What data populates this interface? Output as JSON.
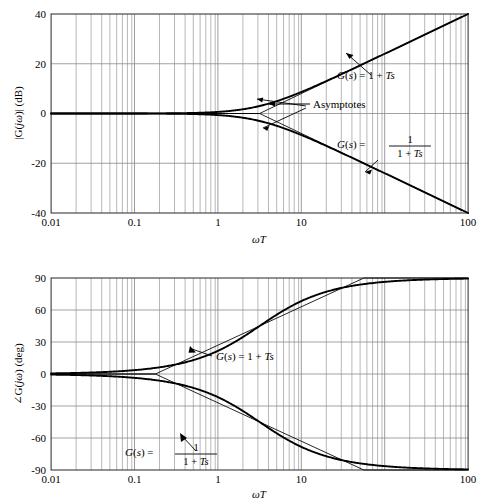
{
  "figure": {
    "kind": "bode-plot-pair"
  },
  "magnitude_plot": {
    "y_axis_label": "|G(jω)| (dB)",
    "x_axis_label": "ωT",
    "y_ticks": [
      "40",
      "20",
      "0",
      "-20",
      "-40"
    ],
    "x_ticks": [
      "0.01",
      "0.1",
      "1",
      "10",
      "100"
    ],
    "annotations": {
      "asymptotes": "Asymptotes",
      "lead_label": "G(s) = 1 + Ts",
      "lag_label_lhs": "G(s) =",
      "lag_label_num": "1",
      "lag_label_den": "1 + Ts"
    }
  },
  "phase_plot": {
    "y_axis_label": "∠G(jω) (deg)",
    "x_axis_label": "ωT",
    "y_ticks": [
      "90",
      "60",
      "30",
      "0",
      "-30",
      "-60",
      "-90"
    ],
    "x_ticks": [
      "0.01",
      "0.1",
      "1",
      "10",
      "100"
    ],
    "annotations": {
      "lead_label": "G(s) = 1 + Ts",
      "lag_label_lhs": "G(s) =",
      "lag_label_num": "1",
      "lag_label_den": "1 + Ts"
    }
  },
  "chart_data": [
    {
      "type": "line",
      "title": "Magnitude Bode plot",
      "xlabel": "ωT",
      "ylabel": "|G(jω)| (dB)",
      "xscale": "log",
      "xlim": [
        0.01,
        100
      ],
      "ylim": [
        -40,
        40
      ],
      "xticks": [
        0.01,
        0.1,
        1,
        10,
        100
      ],
      "yticks": [
        -40,
        -20,
        0,
        20,
        40
      ],
      "grid": true,
      "minor_grid": true,
      "legend": "inline-annotations",
      "series": [
        {
          "name": "G(s) = 1 + Ts",
          "style": "solid-thick",
          "x": [
            0.01,
            0.02,
            0.05,
            0.1,
            0.2,
            0.3,
            0.5,
            0.7,
            1,
            1.5,
            2,
            3,
            5,
            7,
            10,
            20,
            50,
            100
          ],
          "y": [
            0.0,
            0.0,
            0.01,
            0.04,
            0.17,
            0.37,
            0.97,
            1.72,
            3.01,
            5.11,
            6.99,
            10.0,
            14.15,
            16.9,
            20.04,
            26.03,
            33.98,
            40.0
          ]
        },
        {
          "name": "G(s) = 1/(1 + Ts)",
          "style": "solid-thick",
          "x": [
            0.01,
            0.02,
            0.05,
            0.1,
            0.2,
            0.3,
            0.5,
            0.7,
            1,
            1.5,
            2,
            3,
            5,
            7,
            10,
            20,
            50,
            100
          ],
          "y": [
            0.0,
            0.0,
            -0.01,
            -0.04,
            -0.17,
            -0.37,
            -0.97,
            -1.72,
            -3.01,
            -5.11,
            -6.99,
            -10.0,
            -14.15,
            -16.9,
            -20.04,
            -26.03,
            -33.98,
            -40.0
          ]
        },
        {
          "name": "Asymptote (lead)",
          "style": "solid-thin",
          "x": [
            0.01,
            1,
            100
          ],
          "y": [
            0,
            0,
            40
          ]
        },
        {
          "name": "Asymptote (lag)",
          "style": "solid-thin",
          "x": [
            0.01,
            1,
            100
          ],
          "y": [
            0,
            0,
            -40
          ]
        }
      ],
      "annotations": [
        {
          "text": "Asymptotes",
          "x": 2.0,
          "y": 2.0
        },
        {
          "text": "G(s) = 1 + Ts",
          "x": 9.0,
          "y": 14.0
        },
        {
          "text": "G(s) = 1/(1 + Ts)",
          "x": 9.0,
          "y": -11.0
        }
      ],
      "corner_frequency": 1
    },
    {
      "type": "line",
      "title": "Phase Bode plot",
      "xlabel": "ωT",
      "ylabel": "∠G(jω) (deg)",
      "xscale": "log",
      "xlim": [
        0.01,
        100
      ],
      "ylim": [
        -90,
        90
      ],
      "xticks": [
        0.01,
        0.1,
        1,
        10,
        100
      ],
      "yticks": [
        -90,
        -60,
        -30,
        0,
        30,
        60,
        90
      ],
      "grid": true,
      "minor_grid": true,
      "legend": "inline-annotations",
      "series": [
        {
          "name": "G(s) = 1 + Ts",
          "style": "solid-thick",
          "x": [
            0.01,
            0.02,
            0.05,
            0.1,
            0.2,
            0.3,
            0.5,
            0.7,
            1,
            1.5,
            2,
            3,
            5,
            7,
            10,
            20,
            50,
            100
          ],
          "y": [
            0.57,
            1.15,
            2.86,
            5.71,
            11.31,
            16.7,
            26.57,
            34.99,
            45.0,
            56.31,
            63.43,
            71.57,
            78.69,
            81.87,
            84.29,
            87.14,
            88.85,
            89.43
          ]
        },
        {
          "name": "G(s) = 1/(1 + Ts)",
          "style": "solid-thick",
          "x": [
            0.01,
            0.02,
            0.05,
            0.1,
            0.2,
            0.3,
            0.5,
            0.7,
            1,
            1.5,
            2,
            3,
            5,
            7,
            10,
            20,
            50,
            100
          ],
          "y": [
            -0.57,
            -1.15,
            -2.86,
            -5.71,
            -11.31,
            -16.7,
            -26.57,
            -34.99,
            -45.0,
            -56.31,
            -63.43,
            -71.57,
            -78.69,
            -81.87,
            -84.29,
            -87.14,
            -88.85,
            -89.43
          ]
        },
        {
          "name": "Asymptote (lead)",
          "style": "solid-thin",
          "x": [
            0.01,
            0.1,
            10,
            100
          ],
          "y": [
            0,
            0,
            90,
            90
          ]
        },
        {
          "name": "Asymptote (lag)",
          "style": "solid-thin",
          "x": [
            0.01,
            0.1,
            10,
            100
          ],
          "y": [
            0,
            0,
            -90,
            -90
          ]
        }
      ],
      "annotations": [
        {
          "text": "G(s) = 1 + Ts",
          "x": 0.95,
          "y": 20.0
        },
        {
          "text": "G(s) = 1/(1 + Ts)",
          "x": 0.3,
          "y": -38.0
        }
      ],
      "corner_frequencies": [
        0.1,
        10
      ]
    }
  ]
}
